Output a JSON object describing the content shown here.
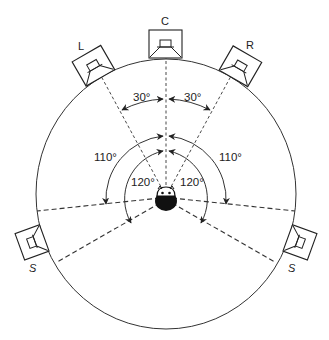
{
  "diagram": {
    "type": "surround-sound speaker placement (5.0)",
    "speakers": [
      {
        "id": "left",
        "label": "L"
      },
      {
        "id": "center",
        "label": "C"
      },
      {
        "id": "right",
        "label": "R"
      },
      {
        "id": "surround-left",
        "label": "S"
      },
      {
        "id": "surround-right",
        "label": "S"
      }
    ],
    "angles": {
      "front_left": "30°",
      "front_right": "30°",
      "surround_min_left": "110°",
      "surround_min_right": "110°",
      "surround_max_left": "120°",
      "surround_max_right": "120°"
    },
    "colors": {
      "line": "#333333",
      "background": "#ffffff",
      "listener": "#111111"
    }
  }
}
